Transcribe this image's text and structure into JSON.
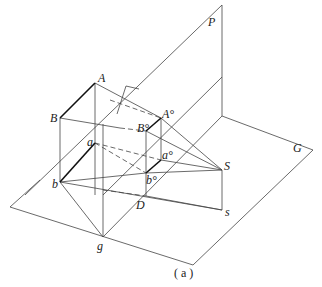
{
  "figure": {
    "caption": "( a )",
    "labels": {
      "P": "P",
      "G": "G",
      "A": "A",
      "B": "B",
      "a": "a",
      "b": "b",
      "A0": "A°",
      "B0": "B°",
      "a0": "a°",
      "b0": "b°",
      "S": "S",
      "s": "s",
      "D": "D",
      "g": "g"
    },
    "colors": {
      "line": "#333333",
      "bold": "#111111"
    }
  }
}
